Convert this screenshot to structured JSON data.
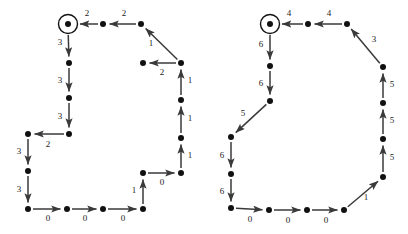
{
  "figure": {
    "title": "",
    "background_color": "#ffffff",
    "node_color": "#111111",
    "edge_color": "#3a3a3a",
    "label_color": "#1a1a1a",
    "node_radius": 3,
    "accept_ring_radius": 9.5,
    "arrow_size": 5
  },
  "graphs": [
    {
      "name": "left-automaton",
      "nodes": [
        {
          "id": "L0",
          "x": 68,
          "y": 24,
          "accepting": true
        },
        {
          "id": "L1",
          "x": 103,
          "y": 24,
          "accepting": false
        },
        {
          "id": "L2",
          "x": 141,
          "y": 24,
          "accepting": false
        },
        {
          "id": "L3",
          "x": 143,
          "y": 63,
          "accepting": false
        },
        {
          "id": "L4",
          "x": 181,
          "y": 63,
          "accepting": false
        },
        {
          "id": "L5",
          "x": 181,
          "y": 100,
          "accepting": false
        },
        {
          "id": "L6",
          "x": 181,
          "y": 138,
          "accepting": false
        },
        {
          "id": "L7",
          "x": 181,
          "y": 173,
          "accepting": false
        },
        {
          "id": "L8",
          "x": 143,
          "y": 173,
          "accepting": false
        },
        {
          "id": "L9",
          "x": 143,
          "y": 209,
          "accepting": false
        },
        {
          "id": "L10",
          "x": 103,
          "y": 209,
          "accepting": false
        },
        {
          "id": "L11",
          "x": 67,
          "y": 209,
          "accepting": false
        },
        {
          "id": "L12",
          "x": 28,
          "y": 209,
          "accepting": false
        },
        {
          "id": "L13",
          "x": 28,
          "y": 171,
          "accepting": false
        },
        {
          "id": "L14",
          "x": 28,
          "y": 134,
          "accepting": false
        },
        {
          "id": "L15",
          "x": 69,
          "y": 134,
          "accepting": false
        },
        {
          "id": "L16",
          "x": 69,
          "y": 98,
          "accepting": false
        },
        {
          "id": "L17",
          "x": 69,
          "y": 63,
          "accepting": false
        }
      ],
      "edges": [
        {
          "from": "L1",
          "to": "L0",
          "label": "2",
          "lx": 87,
          "ly": 14
        },
        {
          "from": "L2",
          "to": "L1",
          "label": "2",
          "lx": 124,
          "ly": 14
        },
        {
          "from": "L4",
          "to": "L2",
          "label": "1",
          "lx": 151,
          "ly": 44
        },
        {
          "from": "L5",
          "to": "L4",
          "label": "1",
          "lx": 190,
          "ly": 81
        },
        {
          "from": "L6",
          "to": "L5",
          "label": "1",
          "lx": 190,
          "ly": 119
        },
        {
          "from": "L7",
          "to": "L6",
          "label": "1",
          "lx": 190,
          "ly": 156
        },
        {
          "from": "L4",
          "to": "L3",
          "label": "2",
          "lx": 162,
          "ly": 73
        },
        {
          "from": "L8",
          "to": "L7",
          "label": "0",
          "lx": 162,
          "ly": 183
        },
        {
          "from": "L9",
          "to": "L8",
          "label": "1",
          "lx": 134,
          "ly": 191
        },
        {
          "from": "L10",
          "to": "L9",
          "label": "0",
          "lx": 123,
          "ly": 219
        },
        {
          "from": "L11",
          "to": "L10",
          "label": "0",
          "lx": 85,
          "ly": 219
        },
        {
          "from": "L12",
          "to": "L11",
          "label": "0",
          "lx": 48,
          "ly": 219
        },
        {
          "from": "L13",
          "to": "L12",
          "label": "3",
          "lx": 19,
          "ly": 190
        },
        {
          "from": "L14",
          "to": "L13",
          "label": "3",
          "lx": 19,
          "ly": 152
        },
        {
          "from": "L15",
          "to": "L14",
          "label": "2",
          "lx": 48,
          "ly": 145
        },
        {
          "from": "L16",
          "to": "L15",
          "label": "3",
          "lx": 60,
          "ly": 117
        },
        {
          "from": "L17",
          "to": "L16",
          "label": "3",
          "lx": 60,
          "ly": 81
        },
        {
          "from": "L0",
          "to": "L17",
          "label": "3",
          "lx": 60,
          "ly": 43
        }
      ]
    },
    {
      "name": "right-automaton",
      "nodes": [
        {
          "id": "R0",
          "x": 270,
          "y": 24,
          "accepting": true
        },
        {
          "id": "R1",
          "x": 308,
          "y": 24,
          "accepting": false
        },
        {
          "id": "R2",
          "x": 347,
          "y": 24,
          "accepting": false
        },
        {
          "id": "R3",
          "x": 383,
          "y": 67,
          "accepting": false
        },
        {
          "id": "R4",
          "x": 383,
          "y": 103,
          "accepting": false
        },
        {
          "id": "R5",
          "x": 383,
          "y": 139,
          "accepting": false
        },
        {
          "id": "R6",
          "x": 383,
          "y": 177,
          "accepting": false
        },
        {
          "id": "R7",
          "x": 344,
          "y": 210,
          "accepting": false
        },
        {
          "id": "R8",
          "x": 307,
          "y": 210,
          "accepting": false
        },
        {
          "id": "R9",
          "x": 269,
          "y": 210,
          "accepting": false
        },
        {
          "id": "R10",
          "x": 231,
          "y": 208,
          "accepting": false
        },
        {
          "id": "R11",
          "x": 231,
          "y": 174,
          "accepting": false
        },
        {
          "id": "R12",
          "x": 231,
          "y": 137,
          "accepting": false
        },
        {
          "id": "R13",
          "x": 270,
          "y": 101,
          "accepting": false
        },
        {
          "id": "R14",
          "x": 270,
          "y": 66,
          "accepting": false
        }
      ],
      "edges": [
        {
          "from": "R1",
          "to": "R0",
          "label": "4",
          "lx": 289,
          "ly": 14
        },
        {
          "from": "R2",
          "to": "R1",
          "label": "4",
          "lx": 329,
          "ly": 14
        },
        {
          "from": "R3",
          "to": "R2",
          "label": "3",
          "lx": 374,
          "ly": 40
        },
        {
          "from": "R4",
          "to": "R3",
          "label": "5",
          "lx": 392,
          "ly": 85
        },
        {
          "from": "R5",
          "to": "R4",
          "label": "5",
          "lx": 392,
          "ly": 121
        },
        {
          "from": "R6",
          "to": "R5",
          "label": "5",
          "lx": 392,
          "ly": 158
        },
        {
          "from": "R7",
          "to": "R6",
          "label": "1",
          "lx": 366,
          "ly": 198
        },
        {
          "from": "R8",
          "to": "R7",
          "label": "0",
          "lx": 326,
          "ly": 221
        },
        {
          "from": "R9",
          "to": "R8",
          "label": "0",
          "lx": 288,
          "ly": 221
        },
        {
          "from": "R10",
          "to": "R9",
          "label": "0",
          "lx": 250,
          "ly": 220
        },
        {
          "from": "R11",
          "to": "R10",
          "label": "6",
          "lx": 222,
          "ly": 192
        },
        {
          "from": "R12",
          "to": "R11",
          "label": "6",
          "lx": 222,
          "ly": 156
        },
        {
          "from": "R13",
          "to": "R12",
          "label": "5",
          "lx": 243,
          "ly": 114
        },
        {
          "from": "R14",
          "to": "R13",
          "label": "6",
          "lx": 261,
          "ly": 84
        },
        {
          "from": "R0",
          "to": "R14",
          "label": "6",
          "lx": 261,
          "ly": 45
        }
      ]
    }
  ]
}
